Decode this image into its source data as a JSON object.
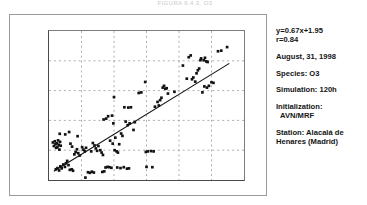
{
  "caption": "FIGURA 6.4.3. O3",
  "chart_data": {
    "type": "scatter",
    "title": "",
    "xlabel": "",
    "ylabel": "",
    "xlim": [
      0,
      60
    ],
    "ylim": [
      0,
      50
    ],
    "xticks": [
      0,
      10,
      20,
      30,
      40,
      50,
      60
    ],
    "yticks": [
      0,
      10,
      20,
      30,
      40,
      50
    ],
    "grid": true,
    "grid_style": "dashed",
    "marker": "filled-square",
    "marker_color": "#111111",
    "series": [
      {
        "name": "observed-vs-simulated",
        "points": [
          [
            1.2,
            12.6
          ],
          [
            1.5,
            11.4
          ],
          [
            1.8,
            13.0
          ],
          [
            2.0,
            12.0
          ],
          [
            2.2,
            10.8
          ],
          [
            2.4,
            12.3
          ],
          [
            2.6,
            11.0
          ],
          [
            2.8,
            13.3
          ],
          [
            3.0,
            11.8
          ],
          [
            3.2,
            10.2
          ],
          [
            3.4,
            12.8
          ],
          [
            3.6,
            11.5
          ],
          [
            2.1,
            3.6
          ],
          [
            2.6,
            4.0
          ],
          [
            3.1,
            3.2
          ],
          [
            3.5,
            4.6
          ],
          [
            3.9,
            3.9
          ],
          [
            4.4,
            5.2
          ],
          [
            4.9,
            4.4
          ],
          [
            5.2,
            5.6
          ],
          [
            3.3,
            15.5
          ],
          [
            5.0,
            15.3
          ],
          [
            6.2,
            16.1
          ],
          [
            6.6,
            12.2
          ],
          [
            7.1,
            11.2
          ],
          [
            5.6,
            6.4
          ],
          [
            6.0,
            5.0
          ],
          [
            6.4,
            3.4
          ],
          [
            7.0,
            3.6
          ],
          [
            7.4,
            3.1
          ],
          [
            7.8,
            8.6
          ],
          [
            8.2,
            9.4
          ],
          [
            8.6,
            10.3
          ],
          [
            9.0,
            9.0
          ],
          [
            9.4,
            8.2
          ],
          [
            8.8,
            14.7
          ],
          [
            10.2,
            11.0
          ],
          [
            10.6,
            10.2
          ],
          [
            11.0,
            9.6
          ],
          [
            11.4,
            10.8
          ],
          [
            11.2,
            0.8
          ],
          [
            12.0,
            2.6
          ],
          [
            12.6,
            2.4
          ],
          [
            13.2,
            2.8
          ],
          [
            13.8,
            2.5
          ],
          [
            13.0,
            9.6
          ],
          [
            13.5,
            12.4
          ],
          [
            14.0,
            11.6
          ],
          [
            14.4,
            10.6
          ],
          [
            14.8,
            9.8
          ],
          [
            15.2,
            11.4
          ],
          [
            15.8,
            10.0
          ],
          [
            16.2,
            9.2
          ],
          [
            16.6,
            8.4
          ],
          [
            16.4,
            2.7
          ],
          [
            17.0,
            2.9
          ],
          [
            17.4,
            4.2
          ],
          [
            18.0,
            4.4
          ],
          [
            18.6,
            4.3
          ],
          [
            19.2,
            4.1
          ],
          [
            16.8,
            20.3
          ],
          [
            17.6,
            20.6
          ],
          [
            18.2,
            21.4
          ],
          [
            19.4,
            21.6
          ],
          [
            19.8,
            19.0
          ],
          [
            18.8,
            13.2
          ],
          [
            19.6,
            12.2
          ],
          [
            20.2,
            10.0
          ],
          [
            20.8,
            9.6
          ],
          [
            21.2,
            9.2
          ],
          [
            20.0,
            27.8
          ],
          [
            20.4,
            14.2
          ],
          [
            21.6,
            12.0
          ],
          [
            22.2,
            15.6
          ],
          [
            22.6,
            14.8
          ],
          [
            21.0,
            4.2
          ],
          [
            22.0,
            4.0
          ],
          [
            23.0,
            4.3
          ],
          [
            24.0,
            3.8
          ],
          [
            24.6,
            3.9
          ],
          [
            23.2,
            24.4
          ],
          [
            24.4,
            24.3
          ],
          [
            25.2,
            24.4
          ],
          [
            23.6,
            19.6
          ],
          [
            24.2,
            18.4
          ],
          [
            24.8,
            19.0
          ],
          [
            26.0,
            16.8
          ],
          [
            26.4,
            19.4
          ],
          [
            27.6,
            29.2
          ],
          [
            28.4,
            29.4
          ],
          [
            29.6,
            32.9
          ],
          [
            29.8,
            9.4
          ],
          [
            30.4,
            9.6
          ],
          [
            30.0,
            4.4
          ],
          [
            31.8,
            4.3
          ],
          [
            31.4,
            9.7
          ],
          [
            32.2,
            9.6
          ],
          [
            32.6,
            24.6
          ],
          [
            33.4,
            26.2
          ],
          [
            33.8,
            25.0
          ],
          [
            34.2,
            26.8
          ],
          [
            34.6,
            27.6
          ],
          [
            35.0,
            31.0
          ],
          [
            35.4,
            31.6
          ],
          [
            35.8,
            30.6
          ],
          [
            36.2,
            30.8
          ],
          [
            36.6,
            29.0
          ],
          [
            38.6,
            29.6
          ],
          [
            41.2,
            38.4
          ],
          [
            42.4,
            34.0
          ],
          [
            43.0,
            41.2
          ],
          [
            43.6,
            41.8
          ],
          [
            44.0,
            33.8
          ],
          [
            44.4,
            34.4
          ],
          [
            45.0,
            33.0
          ],
          [
            45.4,
            35.8
          ],
          [
            45.8,
            36.8
          ],
          [
            46.2,
            37.4
          ],
          [
            46.6,
            40.2
          ],
          [
            46.8,
            40.8
          ],
          [
            47.2,
            29.4
          ],
          [
            47.6,
            40.2
          ],
          [
            48.0,
            41.0
          ],
          [
            48.4,
            39.8
          ],
          [
            48.8,
            39.6
          ],
          [
            47.8,
            31.4
          ],
          [
            48.6,
            31.0
          ],
          [
            49.2,
            31.6
          ],
          [
            50.0,
            32.8
          ],
          [
            50.6,
            32.6
          ],
          [
            52.0,
            43.2
          ],
          [
            53.0,
            43.4
          ],
          [
            54.8,
            44.6
          ]
        ]
      }
    ],
    "regression_line": {
      "slope": 0.67,
      "intercept": 1.95,
      "x_start": 1.5,
      "x_end": 55.5,
      "color": "#111111"
    }
  },
  "info": {
    "equation": "y=0.67x+1.95",
    "correlation": "r=0.84",
    "date": "August, 31, 1998",
    "species": "Species: O3",
    "simulation": "Simulation: 120h",
    "initialization_label": "Initialization:",
    "initialization_value": "AVN/MRF",
    "station": "Station: Alacalá de Henares (Madrid)"
  }
}
